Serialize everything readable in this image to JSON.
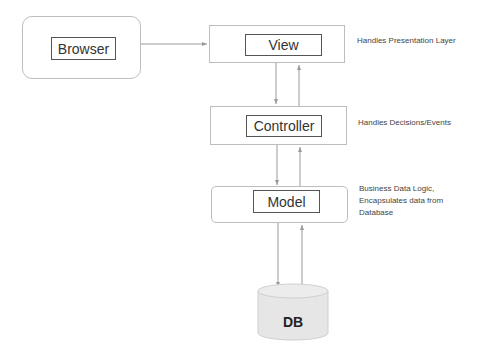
{
  "diagram": {
    "type": "mvc-architecture",
    "nodes": {
      "browser": {
        "label": "Browser"
      },
      "view": {
        "label": "View",
        "note": "Handles Presentation Layer"
      },
      "controller": {
        "label": "Controller",
        "note": "Handles Decisions/Events"
      },
      "model": {
        "label": "Model",
        "note": "Business Data Logic,\nEncapsulates data from\nDatabase"
      },
      "db": {
        "label": "DB"
      }
    },
    "edges": [
      {
        "from": "browser",
        "to": "view"
      },
      {
        "from": "view",
        "to": "controller"
      },
      {
        "from": "controller",
        "to": "view"
      },
      {
        "from": "controller",
        "to": "model"
      },
      {
        "from": "model",
        "to": "controller"
      },
      {
        "from": "model",
        "to": "db"
      },
      {
        "from": "db",
        "to": "model"
      }
    ],
    "colors": {
      "outer_border": "#bdbdbd",
      "inner_border": "#555555",
      "arrow": "#9a9a9a",
      "db_fill": "#e6e6e6"
    }
  }
}
